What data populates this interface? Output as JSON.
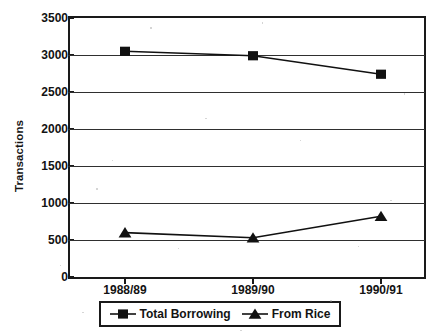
{
  "chart_data": {
    "type": "line",
    "title": "",
    "subtitle": "",
    "xlabel": "",
    "ylabel": "Transactions",
    "categories": [
      "1988/89",
      "1989/90",
      "1990/91"
    ],
    "series": [
      {
        "name": "Total Borrowing",
        "marker": "square",
        "color": "#111111",
        "values": [
          3050,
          2990,
          2740
        ]
      },
      {
        "name": "From Rice",
        "marker": "triangle",
        "color": "#111111",
        "values": [
          600,
          530,
          820
        ]
      }
    ],
    "ylim": [
      0,
      3500
    ],
    "ytick_interval": 500,
    "yticks": [
      0,
      500,
      1000,
      1500,
      2000,
      2500,
      3000,
      3500
    ],
    "ytick_labels": [
      "0",
      "500",
      "1000",
      "1500",
      "2000",
      "2500",
      "3000",
      "3500"
    ],
    "grid": "horizontal",
    "legend_position": "bottom-center",
    "legend_entries": [
      "Total Borrowing",
      "From Rice"
    ]
  },
  "axes": {
    "y_title": "Transactions"
  }
}
